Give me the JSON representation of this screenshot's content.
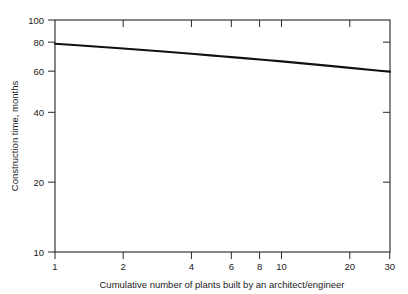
{
  "chart_data": {
    "type": "line",
    "title": "",
    "subtitle": "",
    "xlabel": "Cumulative number of plants built by an architect/engineer",
    "ylabel": "Construction time, months",
    "xscale": "log",
    "yscale": "log",
    "xlim": [
      1,
      30
    ],
    "ylim": [
      10,
      100
    ],
    "grid": false,
    "legend": null,
    "xticks": [
      1,
      2,
      4,
      6,
      8,
      10,
      20,
      30
    ],
    "xticklabels": [
      "1",
      "2",
      "4",
      "6",
      "8",
      "10",
      "20",
      "30"
    ],
    "yticks": [
      10,
      20,
      40,
      60,
      80,
      100
    ],
    "yticklabels": [
      "10",
      "20",
      "40",
      "60",
      "80",
      "100"
    ],
    "series": [
      {
        "name": "Construction time learning curve",
        "x": [
          1,
          1.5,
          2,
          3,
          4,
          5,
          6,
          8,
          10,
          15,
          20,
          25,
          30
        ],
        "values": [
          79.0,
          76.9,
          75.4,
          73.1,
          71.5,
          70.2,
          69.2,
          67.6,
          66.3,
          63.9,
          62.2,
          60.9,
          59.8
        ]
      }
    ],
    "annotations": []
  },
  "axes": {
    "y_title": "Construction time, months",
    "x_title": "Cumulative number of plants built by an architect/engineer"
  }
}
